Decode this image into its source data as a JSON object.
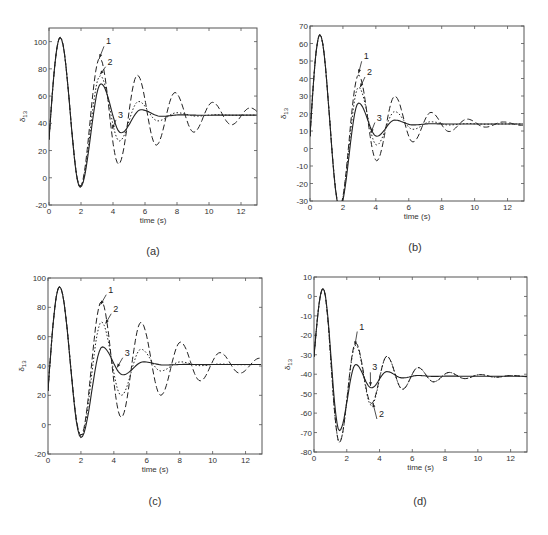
{
  "figure": {
    "captions": [
      "(a)",
      "(b)",
      "(c)",
      "(d)"
    ]
  },
  "chart_data": [
    {
      "id": "a",
      "caption": "(a)",
      "type": "line",
      "title": "",
      "xlabel": "time (s)",
      "ylabel": "δ13",
      "xlim": [
        0,
        13
      ],
      "ylim": [
        -20,
        110
      ],
      "xticks": [
        0,
        2,
        4,
        6,
        8,
        10,
        12
      ],
      "yticks": [
        -20,
        0,
        20,
        40,
        60,
        80,
        100
      ],
      "grid": false,
      "box": {
        "left": 49,
        "top": 28,
        "right": 257,
        "bottom": 205
      },
      "signal_model": {
        "start": 28,
        "final": 46,
        "first_peak_t": 0.7,
        "first_peak": 103,
        "first_trough_t": 1.95
      },
      "series": [
        {
          "name": "1",
          "style": "dashed",
          "period": 2.35,
          "decay": 0.11,
          "second_peak": 88,
          "second_trough": 10
        },
        {
          "name": "2",
          "style": "dotted",
          "period": 2.4,
          "decay": 0.33,
          "second_peak": 75,
          "second_trough": 27
        },
        {
          "name": "3",
          "style": "solid",
          "period": 2.5,
          "decay": 0.55,
          "second_peak": 69,
          "second_trough": 33
        }
      ],
      "annotations": [
        {
          "label": "1",
          "x": 3.5,
          "y": 98,
          "arrow_to": [
            3.15,
            88
          ]
        },
        {
          "label": "2",
          "x": 3.6,
          "y": 83,
          "arrow_to": [
            3.2,
            76
          ]
        },
        {
          "label": "3",
          "x": 4.25,
          "y": 44,
          "arrow_to": [
            3.95,
            36
          ]
        }
      ]
    },
    {
      "id": "b",
      "caption": "(b)",
      "type": "line",
      "title": "",
      "xlabel": "time (s)",
      "ylabel": "δ13",
      "xlim": [
        0,
        13
      ],
      "ylim": [
        -30,
        70
      ],
      "xticks": [
        0,
        2,
        4,
        6,
        8,
        10,
        12
      ],
      "yticks": [
        -30,
        -20,
        -10,
        0,
        10,
        20,
        30,
        40,
        50,
        60,
        70
      ],
      "grid": false,
      "box": {
        "left": 310,
        "top": 26,
        "right": 524,
        "bottom": 201
      },
      "signal_model": {
        "start": 7,
        "final": 14,
        "first_peak_t": 0.6,
        "first_peak": 65,
        "first_trough_t": 1.8
      },
      "series": [
        {
          "name": "1",
          "style": "dashed",
          "period": 2.2,
          "decay": 0.18,
          "second_peak": 42,
          "second_trough": -7
        },
        {
          "name": "2",
          "style": "dotted",
          "period": 2.2,
          "decay": 0.35,
          "second_peak": 35,
          "second_trough": 2
        },
        {
          "name": "3",
          "style": "solid",
          "period": 2.2,
          "decay": 0.6,
          "second_peak": 26,
          "second_trough": 7
        }
      ],
      "annotations": [
        {
          "label": "1",
          "x": 3.2,
          "y": 51,
          "arrow_to": [
            2.95,
            43
          ]
        },
        {
          "label": "2",
          "x": 3.4,
          "y": 42,
          "arrow_to": [
            3.05,
            35
          ]
        },
        {
          "label": "3",
          "x": 4.0,
          "y": 16,
          "arrow_to": [
            3.7,
            9
          ]
        }
      ]
    },
    {
      "id": "c",
      "caption": "(c)",
      "type": "line",
      "title": "",
      "xlabel": "time (s)",
      "ylabel": "δ13",
      "xlim": [
        0,
        13
      ],
      "ylim": [
        -20,
        100
      ],
      "xticks": [
        0,
        2,
        4,
        6,
        8,
        10,
        12
      ],
      "yticks": [
        -20,
        0,
        20,
        40,
        60,
        80,
        100
      ],
      "grid": false,
      "box": {
        "left": 48,
        "top": 278,
        "right": 262,
        "bottom": 454
      },
      "signal_model": {
        "start": 23,
        "final": 41,
        "first_peak_t": 0.7,
        "first_peak": 94,
        "first_trough_t": 2.0
      },
      "series": [
        {
          "name": "1",
          "style": "dashed",
          "period": 2.4,
          "decay": 0.12,
          "second_peak": 84,
          "second_trough": 5
        },
        {
          "name": "2",
          "style": "dotted",
          "period": 2.4,
          "decay": 0.33,
          "second_peak": 70,
          "second_trough": 20
        },
        {
          "name": "3",
          "style": "solid",
          "period": 2.5,
          "decay": 0.6,
          "second_peak": 53,
          "second_trough": 34
        }
      ],
      "annotations": [
        {
          "label": "1",
          "x": 3.6,
          "y": 90,
          "arrow_to": [
            3.2,
            82
          ]
        },
        {
          "label": "2",
          "x": 3.9,
          "y": 77,
          "arrow_to": [
            3.5,
            69
          ]
        },
        {
          "label": "3",
          "x": 4.6,
          "y": 47,
          "arrow_to": [
            4.2,
            39
          ]
        }
      ]
    },
    {
      "id": "d",
      "caption": "(d)",
      "type": "line",
      "title": "",
      "xlabel": "time (s)",
      "ylabel": "δ13",
      "xlim": [
        0,
        13
      ],
      "ylim": [
        -80,
        10
      ],
      "xticks": [
        0,
        2,
        4,
        6,
        8,
        10,
        12
      ],
      "yticks": [
        -80,
        -70,
        -60,
        -50,
        -40,
        -30,
        -20,
        -10,
        0,
        10
      ],
      "grid": false,
      "box": {
        "left": 314,
        "top": 277,
        "right": 527,
        "bottom": 452
      },
      "signal_model": {
        "start": -31,
        "final": -41,
        "first_peak_t": 0.55,
        "first_peak": 4,
        "first_trough_t": 1.55
      },
      "series": [
        {
          "name": "1",
          "style": "dashed",
          "period": 1.9,
          "decay": 0.2,
          "second_peak": -24,
          "second_trough": -55,
          "first_trough": -75
        },
        {
          "name": "2",
          "style": "dotted",
          "period": 1.9,
          "decay": 0.2,
          "second_peak": -25,
          "second_trough": -56,
          "first_trough": -75
        },
        {
          "name": "3",
          "style": "solid",
          "period": 1.9,
          "decay": 0.45,
          "second_peak": -35,
          "second_trough": -47,
          "first_trough": -69
        }
      ],
      "annotations": [
        {
          "label": "1",
          "x": 2.7,
          "y": -17,
          "arrow_to": [
            2.5,
            -25
          ]
        },
        {
          "label": "3",
          "x": 3.5,
          "y": -38,
          "arrow_to": [
            3.45,
            -46
          ]
        },
        {
          "label": "2",
          "x": 3.9,
          "y": -62,
          "arrow_to": [
            3.6,
            -55
          ]
        }
      ]
    }
  ]
}
